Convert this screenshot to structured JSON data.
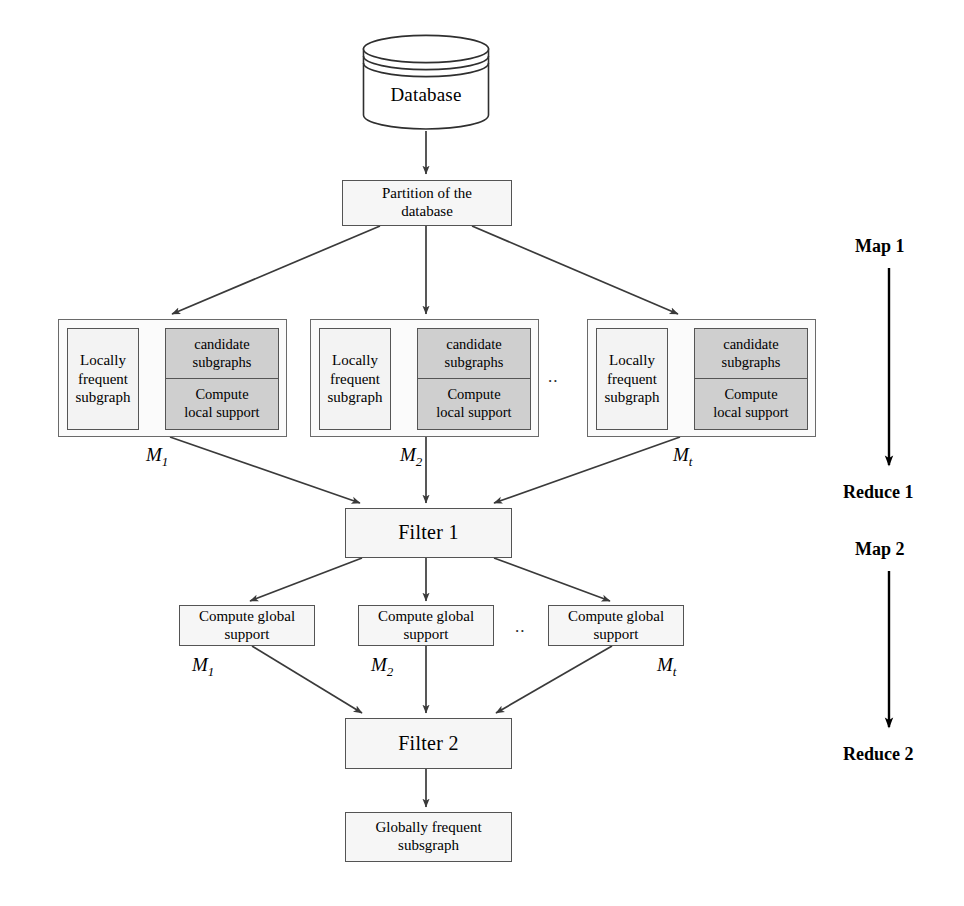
{
  "figure": {
    "database": {
      "label": "Database",
      "icon": "database-cylinder-icon"
    },
    "partition": {
      "label": "Partition of the\ndatabase",
      "line1": "Partition of the",
      "line2": "database"
    },
    "map1_groups": [
      {
        "id": "M1",
        "mapper_label": "M",
        "mapper_sub": "1",
        "left": {
          "line1": "Locally",
          "line2": "frequent",
          "line3": "subgraph"
        },
        "right_top": {
          "line1": "candidate",
          "line2": "subgraphs"
        },
        "right_bottom": {
          "line1": "Compute",
          "line2": "local support"
        }
      },
      {
        "id": "M2",
        "mapper_label": "M",
        "mapper_sub": "2",
        "left": {
          "line1": "Locally",
          "line2": "frequent",
          "line3": "subgraph"
        },
        "right_top": {
          "line1": "candidate",
          "line2": "subgraphs"
        },
        "right_bottom": {
          "line1": "Compute",
          "line2": "local support"
        }
      },
      {
        "id": "Mt",
        "mapper_label": "M",
        "mapper_sub": "t",
        "left": {
          "line1": "Locally",
          "line2": "frequent",
          "line3": "subgraph"
        },
        "right_top": {
          "line1": "candidate",
          "line2": "subgraphs"
        },
        "right_bottom": {
          "line1": "Compute",
          "line2": "local support"
        }
      }
    ],
    "ellipsis_map1": "..",
    "filter1": {
      "label": "Filter 1"
    },
    "map2_groups": [
      {
        "id": "M1",
        "mapper_label": "M",
        "mapper_sub": "1",
        "line1": "Compute global",
        "line2": "support"
      },
      {
        "id": "M2",
        "mapper_label": "M",
        "mapper_sub": "2",
        "line1": "Compute global",
        "line2": "support"
      },
      {
        "id": "Mt",
        "mapper_label": "M",
        "mapper_sub": "t",
        "line1": "Compute global",
        "line2": "support"
      }
    ],
    "ellipsis_map2": "..",
    "filter2": {
      "label": "Filter 2"
    },
    "result": {
      "line1": "Globally frequent",
      "line2": "subsgraph"
    },
    "phases": [
      {
        "id": "map-1",
        "label": "Map 1"
      },
      {
        "id": "reduce-1",
        "label": "Reduce 1"
      },
      {
        "id": "map-2",
        "label": "Map 2"
      },
      {
        "id": "reduce-2",
        "label": "Reduce 2"
      }
    ],
    "colors": {
      "stroke": "#4a4a4a",
      "box_fill": "#f4f4f4",
      "shaded_fill": "#cfcfcf",
      "background": "#ffffff",
      "text": "#000000"
    }
  }
}
